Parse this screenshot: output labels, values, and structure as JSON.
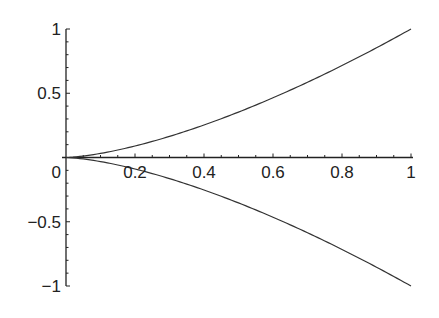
{
  "chart_data": {
    "type": "line",
    "title": "",
    "xlabel": "",
    "ylabel": "",
    "xlim": [
      0,
      1
    ],
    "ylim": [
      -1,
      1
    ],
    "grid": false,
    "legend": null,
    "x_ticks": [
      0.2,
      0.4,
      0.6,
      0.8,
      1
    ],
    "x_tick_labels": [
      "0.2",
      "0.4",
      "0.6",
      "0.8",
      "1"
    ],
    "y_ticks": [
      -1,
      -0.5,
      0,
      0.5,
      1
    ],
    "y_tick_labels": [
      "−1",
      "−0.5",
      "0",
      "0.5",
      "1"
    ],
    "series": [
      {
        "name": "upper",
        "expression": "y = x^(3/2)",
        "x": [
          0,
          0.1,
          0.2,
          0.3,
          0.4,
          0.5,
          0.6,
          0.7,
          0.8,
          0.9,
          1.0
        ],
        "y": [
          0,
          0.032,
          0.089,
          0.164,
          0.253,
          0.354,
          0.465,
          0.586,
          0.716,
          0.854,
          1.0
        ]
      },
      {
        "name": "lower",
        "expression": "y = -x^(3/2)",
        "x": [
          0,
          0.1,
          0.2,
          0.3,
          0.4,
          0.5,
          0.6,
          0.7,
          0.8,
          0.9,
          1.0
        ],
        "y": [
          0,
          -0.032,
          -0.089,
          -0.164,
          -0.253,
          -0.354,
          -0.465,
          -0.586,
          -0.716,
          -0.854,
          -1.0
        ]
      }
    ],
    "colors": {
      "line": "#333333",
      "axis": "#222222"
    }
  }
}
